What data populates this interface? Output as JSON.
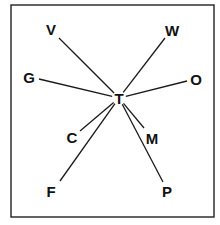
{
  "diagram": {
    "type": "star-network",
    "center": {
      "label": "T",
      "x": 119,
      "y": 98
    },
    "frame": {
      "x": 11,
      "y": 5,
      "width": 203,
      "height": 212
    },
    "nodes": [
      {
        "label": "V",
        "x": 51,
        "y": 29,
        "line_x": 59,
        "line_y": 38
      },
      {
        "label": "W",
        "x": 172,
        "y": 30,
        "line_x": 165,
        "line_y": 38
      },
      {
        "label": "G",
        "x": 29,
        "y": 77,
        "line_x": 39,
        "line_y": 79
      },
      {
        "label": "O",
        "x": 196,
        "y": 79,
        "line_x": 187,
        "line_y": 81
      },
      {
        "label": "C",
        "x": 72,
        "y": 137,
        "line_x": 80,
        "line_y": 131
      },
      {
        "label": "M",
        "x": 152,
        "y": 138,
        "line_x": 144,
        "line_y": 128
      },
      {
        "label": "F",
        "x": 51,
        "y": 191,
        "line_x": 60,
        "line_y": 181
      },
      {
        "label": "P",
        "x": 167,
        "y": 191,
        "line_x": 163,
        "line_y": 182
      }
    ]
  }
}
